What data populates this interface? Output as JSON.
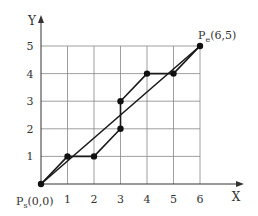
{
  "diagram": {
    "type": "grid_path_approximation",
    "axes": {
      "x_label": "X",
      "y_label": "Y",
      "x_ticks": [
        "1",
        "2",
        "3",
        "4",
        "5",
        "6"
      ],
      "y_ticks": [
        "1",
        "2",
        "3",
        "4",
        "5"
      ]
    },
    "start_point": {
      "label": "P",
      "subscript": "s",
      "coords": "(0,0)",
      "x": 0,
      "y": 0
    },
    "end_point": {
      "label": "P",
      "subscript": "e",
      "coords": "(6,5)",
      "x": 6,
      "y": 5
    },
    "ideal_line": [
      [
        0,
        0
      ],
      [
        6,
        5
      ]
    ],
    "step_path": [
      [
        0,
        0
      ],
      [
        1,
        1
      ],
      [
        2,
        1
      ],
      [
        3,
        2
      ],
      [
        3,
        3
      ],
      [
        4,
        4
      ],
      [
        5,
        4
      ],
      [
        6,
        5
      ]
    ],
    "colors": {
      "grid": "#888888",
      "line": "#1a1a1a",
      "point": "#111111",
      "text": "#333333"
    }
  }
}
